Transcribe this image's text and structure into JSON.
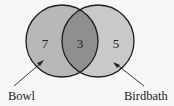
{
  "diagram": {
    "type": "venn",
    "sets": [
      {
        "label": "Bowl",
        "only_count": "7",
        "fill": "#b8b8b8"
      },
      {
        "label": "Birdbath",
        "only_count": "5",
        "fill": "#c8c8c8"
      }
    ],
    "intersection": {
      "count": "3",
      "fill": "#8e8e8e"
    },
    "colors": {
      "background": "#f7f7f7",
      "stroke": "#1e1e1e",
      "text": "#222222"
    }
  }
}
